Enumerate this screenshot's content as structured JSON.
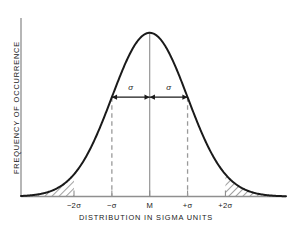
{
  "chart_data": {
    "type": "line",
    "title": "",
    "subtitle": "",
    "xlabel": "DISTRIBUTION IN SIGMA UNITS",
    "ylabel": "FREQUENCY OF OCCURRENCE",
    "grid": false,
    "legend": "none",
    "xlim": [
      -3.4,
      3.6
    ],
    "ylim": [
      0,
      1.06
    ],
    "xticks": [
      -2,
      -1,
      0,
      1,
      2
    ],
    "xticklabels": [
      "−2σ",
      "−σ",
      "M",
      "+σ",
      "+2σ"
    ],
    "yticks": [],
    "yticklabels": [],
    "curve": {
      "name": "normal distribution",
      "mean": 0,
      "sigma": 1,
      "peak_value": 1.0,
      "x": [
        -3.4,
        -3.2,
        -3.0,
        -2.8,
        -2.6,
        -2.4,
        -2.2,
        -2.0,
        -1.8,
        -1.6,
        -1.4,
        -1.2,
        -1.0,
        -0.8,
        -0.6,
        -0.4,
        -0.2,
        0.0,
        0.2,
        0.4,
        0.6,
        0.8,
        1.0,
        1.2,
        1.4,
        1.6,
        1.8,
        2.0,
        2.2,
        2.4,
        2.6,
        2.8,
        3.0,
        3.2,
        3.4
      ],
      "y": [
        0.003,
        0.006,
        0.011,
        0.02,
        0.034,
        0.056,
        0.089,
        0.135,
        0.198,
        0.278,
        0.375,
        0.487,
        0.607,
        0.726,
        0.835,
        0.923,
        0.98,
        1.0,
        0.98,
        0.923,
        0.835,
        0.726,
        0.607,
        0.487,
        0.375,
        0.278,
        0.198,
        0.135,
        0.089,
        0.056,
        0.034,
        0.02,
        0.011,
        0.006,
        0.003
      ]
    },
    "annotations": [
      {
        "name": "sigma-left",
        "label": "σ",
        "from_x": -1,
        "to_x": 0,
        "at_y": 0.607,
        "arrow": "double"
      },
      {
        "name": "sigma-right",
        "label": "σ",
        "from_x": 0,
        "to_x": 1,
        "at_y": 0.607,
        "arrow": "double"
      }
    ],
    "vertical_lines": [
      {
        "name": "mean-line",
        "x": 0,
        "style": "solid",
        "color": "#8c8c8c"
      },
      {
        "name": "minus-sigma-line",
        "x": -1,
        "style": "dashed",
        "color": "#9a9a9a"
      },
      {
        "name": "plus-sigma-line",
        "x": 1,
        "style": "dashed",
        "color": "#9a9a9a"
      }
    ],
    "shaded_regions": [
      {
        "name": "left-tail",
        "from_x": -3.4,
        "to_x": -2,
        "hatch": "diagonal",
        "color": "#2a2a2a"
      },
      {
        "name": "right-tail",
        "from_x": 2,
        "to_x": 3.4,
        "hatch": "diagonal",
        "color": "#2a2a2a"
      }
    ]
  },
  "colors": {
    "curve": "#1a1a1a",
    "axis": "#8f8f8f",
    "text": "#1a1a1a",
    "background": "#ffffff",
    "hatch": "#2f2f2f",
    "dashed": "#9a9a9a"
  }
}
